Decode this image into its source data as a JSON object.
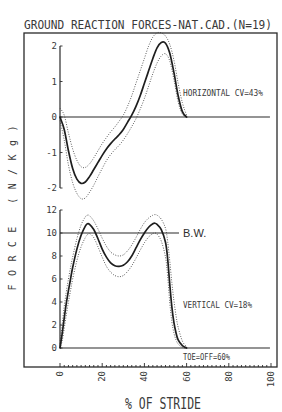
{
  "chart_data": {
    "type": "line",
    "title": "GROUND REACTION FORCES-NAT.CAD.(N=19)",
    "xlabel": "% OF STRIDE",
    "ylabel": "FORCE (N/Kg)",
    "xlim": [
      0,
      100
    ],
    "x_ticks": [
      "0",
      "20",
      "40",
      "60",
      "80",
      "100"
    ],
    "grid": false,
    "legend": null,
    "panels": [
      {
        "name": "horizontal",
        "label": "HORIZONTAL  CV=43%",
        "ylim": [
          -2,
          2
        ],
        "y_ticks": [
          "2",
          "1",
          "0",
          "-1",
          "-2"
        ],
        "zero_line": {
          "value": 0,
          "x_end": 99.5
        },
        "series": [
          {
            "name": "mean",
            "style": "solid",
            "x": [
              0,
              2,
              4,
              6,
              8,
              10,
              12,
              14,
              16,
              18,
              20,
              22,
              24,
              26,
              28,
              30,
              32,
              34,
              36,
              38,
              40,
              42,
              44,
              46,
              48,
              50,
              52,
              54,
              56,
              58,
              60
            ],
            "values": [
              0,
              -0.35,
              -0.95,
              -1.45,
              -1.75,
              -1.87,
              -1.83,
              -1.68,
              -1.48,
              -1.28,
              -1.08,
              -0.9,
              -0.75,
              -0.62,
              -0.5,
              -0.35,
              -0.15,
              0.05,
              0.3,
              0.6,
              0.95,
              1.3,
              1.65,
              1.95,
              2.1,
              2.08,
              1.8,
              1.25,
              0.6,
              0.15,
              0
            ]
          },
          {
            "name": "mean + 1 SD",
            "style": "dotted",
            "x": [
              0,
              2,
              4,
              6,
              8,
              10,
              12,
              14,
              16,
              18,
              20,
              22,
              24,
              26,
              28,
              30,
              32,
              34,
              36,
              38,
              40,
              42,
              44,
              46,
              48,
              50,
              52,
              54,
              56,
              58,
              60
            ],
            "values": [
              0.25,
              0.05,
              -0.45,
              -0.9,
              -1.22,
              -1.4,
              -1.42,
              -1.32,
              -1.15,
              -0.95,
              -0.75,
              -0.58,
              -0.42,
              -0.28,
              -0.12,
              0.05,
              0.3,
              0.6,
              0.95,
              1.3,
              1.65,
              2.0,
              2.25,
              2.37,
              2.37,
              2.28,
              2.05,
              1.6,
              0.95,
              0.4,
              0.05
            ]
          },
          {
            "name": "mean - 1 SD",
            "style": "dotted",
            "x": [
              0,
              2,
              4,
              6,
              8,
              10,
              12,
              14,
              16,
              18,
              20,
              22,
              24,
              26,
              28,
              30,
              32,
              34,
              36,
              38,
              40,
              42,
              44,
              46,
              48,
              50,
              52,
              54,
              56,
              58,
              60
            ],
            "values": [
              -0.1,
              -0.65,
              -1.35,
              -1.85,
              -2.15,
              -2.3,
              -2.28,
              -2.12,
              -1.92,
              -1.68,
              -1.45,
              -1.23,
              -1.06,
              -0.92,
              -0.8,
              -0.65,
              -0.47,
              -0.27,
              -0.05,
              0.22,
              0.52,
              0.87,
              1.22,
              1.52,
              1.72,
              1.78,
              1.58,
              1.05,
              0.42,
              0.08,
              0
            ]
          }
        ]
      },
      {
        "name": "vertical",
        "label": "VERTICAL  CV=18%",
        "ylim": [
          0,
          12
        ],
        "y_ticks": [
          "12",
          "10",
          "8",
          "6",
          "4",
          "2",
          "0"
        ],
        "zero_line": {
          "value": 0,
          "x_end": 99.5
        },
        "reference_line": {
          "label": "B.W.",
          "value": 10,
          "x_end": 56.4
        },
        "annotation": "TOE=OFF=60%",
        "series": [
          {
            "name": "mean",
            "style": "solid",
            "x": [
              0,
              1,
              2,
              3,
              4,
              5,
              6,
              8,
              10,
              12,
              13,
              14,
              16,
              18,
              20,
              22,
              24,
              26,
              28,
              30,
              32,
              34,
              36,
              38,
              40,
              42,
              44,
              45,
              46,
              48,
              50,
              51,
              52,
              53,
              54,
              55,
              56,
              58,
              60
            ],
            "values": [
              0,
              1.2,
              2.6,
              3.9,
              5.0,
              6.0,
              7.0,
              8.6,
              9.8,
              10.6,
              10.8,
              10.75,
              10.3,
              9.5,
              8.6,
              7.9,
              7.4,
              7.15,
              7.1,
              7.2,
              7.5,
              8.0,
              8.7,
              9.4,
              10.0,
              10.5,
              10.8,
              10.85,
              10.75,
              10.3,
              9.2,
              7.8,
              5.6,
              3.6,
              2.2,
              1.3,
              0.7,
              0.2,
              0
            ]
          },
          {
            "name": "mean + 1 SD",
            "style": "dotted",
            "x": [
              0,
              1,
              2,
              3,
              4,
              5,
              6,
              8,
              10,
              12,
              13,
              14,
              16,
              18,
              20,
              22,
              24,
              26,
              28,
              30,
              32,
              34,
              36,
              38,
              40,
              42,
              44,
              45,
              46,
              48,
              50,
              51,
              52,
              53,
              54,
              55,
              56,
              58,
              60
            ],
            "values": [
              0.4,
              2.0,
              3.6,
              4.9,
              6.0,
              7.0,
              7.9,
              9.5,
              10.7,
              11.4,
              11.55,
              11.5,
              11.05,
              10.35,
              9.55,
              8.85,
              8.35,
              8.1,
              8.0,
              8.1,
              8.45,
              8.95,
              9.6,
              10.3,
              10.9,
              11.3,
              11.55,
              11.6,
              11.55,
              11.2,
              10.4,
              9.3,
              7.6,
              5.7,
              4.1,
              2.8,
              1.8,
              0.6,
              0.1
            ]
          },
          {
            "name": "mean - 1 SD",
            "style": "dotted",
            "x": [
              0,
              1,
              2,
              3,
              4,
              5,
              6,
              8,
              10,
              12,
              13,
              14,
              16,
              18,
              20,
              22,
              24,
              26,
              28,
              30,
              32,
              34,
              36,
              38,
              40,
              42,
              44,
              45,
              46,
              48,
              50,
              51,
              52,
              53,
              54,
              55,
              56,
              58,
              60
            ],
            "values": [
              0,
              0.6,
              1.7,
              2.9,
              4.0,
              5.0,
              6.0,
              7.6,
              8.8,
              9.6,
              9.85,
              9.95,
              9.6,
              8.8,
              7.9,
              7.1,
              6.6,
              6.3,
              6.2,
              6.3,
              6.65,
              7.15,
              7.8,
              8.5,
              9.15,
              9.65,
              9.95,
              10.0,
              9.9,
              9.3,
              7.9,
              6.3,
              4.0,
              2.3,
              1.3,
              0.7,
              0.35,
              0.05,
              0
            ]
          }
        ]
      }
    ]
  }
}
